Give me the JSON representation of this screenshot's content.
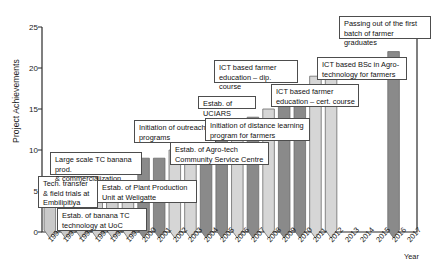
{
  "chart_data": {
    "type": "bar",
    "title": "",
    "xlabel": "Year",
    "ylabel": "Project Achievements",
    "ylim": [
      0,
      25
    ],
    "yticks": [
      0,
      5,
      10,
      15,
      20,
      25
    ],
    "grid": false,
    "legend": "none",
    "categories": [
      "1994",
      "1995",
      "1996",
      "1997",
      "1998",
      "1999",
      "2000",
      "2001",
      "2002",
      "2003",
      "2004",
      "2005",
      "2006",
      "2007",
      "2008",
      "2009",
      "2010",
      "2011",
      "2012",
      "2013",
      "2014",
      "2015",
      "2016",
      "2017"
    ],
    "values": [
      3,
      3,
      3,
      4,
      4,
      5,
      9,
      9,
      10,
      12,
      12,
      12,
      12,
      14,
      15,
      16,
      16,
      19,
      19,
      0,
      0,
      0,
      22,
      0
    ],
    "series": [
      {
        "name": "Project Achievements",
        "values": [
          3,
          3,
          3,
          4,
          4,
          5,
          9,
          9,
          10,
          12,
          12,
          12,
          12,
          14,
          15,
          16,
          16,
          19,
          19,
          0,
          0,
          0,
          22,
          0
        ]
      }
    ],
    "bar_shape": "pointed-bottom-chevron",
    "bar_colors": [
      "#c9c9c9",
      "#c9c9c9",
      "#c9c9c9",
      "#cfcfcf",
      "#cfcfcf",
      "#d2d2d2",
      "#8a8a8a",
      "#8a8a8a",
      "#d6d6d6",
      "#d6d6d6",
      "#8a8a8a",
      "#8a8a8a",
      "#d6d6d6",
      "#8a8a8a",
      "#d6d6d6",
      "#8a8a8a",
      "#8a8a8a",
      "#d6d6d6",
      "#d6d6d6",
      "",
      "",
      "",
      "#8a8a8a",
      ""
    ],
    "annotations": [
      {
        "text": "Tech. transfer\n& field trials at\nEmbilipitiya",
        "year": 1994
      },
      {
        "text": "Estab. of banana TC\ntechnology at UoC",
        "year": 1996
      },
      {
        "text": "Large scale TC banana prod.\n& commercialization",
        "year": 1997
      },
      {
        "text": "Estab. of Plant Production\nUnit at Weligatte",
        "year": 1999
      },
      {
        "text": "Initiation of outreach\nprograms",
        "year": 2002
      },
      {
        "text": "Estab. of Agro-tech\nCommunity Service Centre",
        "year": 2003
      },
      {
        "text": "Estab. of UCIARS",
        "year": 2005
      },
      {
        "text": "Initiation of distance learning\nprogram for farmers",
        "year": 2006
      },
      {
        "text": "ICT based farmer\neducation – dip. course",
        "year": 2007
      },
      {
        "text": "ICT based farmer\neducation – cert. course",
        "year": 2009
      },
      {
        "text": "ICT based BSc in Agro-\ntechnology for farmers",
        "year": 2011
      },
      {
        "text": "Passing out of the first\nbatch of farmer graduates",
        "year": 2014
      }
    ]
  },
  "axis": {
    "y_label": "Project Achievements",
    "x_label": "Year",
    "y_ticks": [
      "0",
      "5",
      "10",
      "15",
      "20",
      "25"
    ],
    "x_ticks": [
      "1994",
      "1995",
      "1996",
      "1997",
      "1998",
      "1999",
      "2000",
      "2001",
      "2002",
      "2003",
      "2004",
      "2005",
      "2006",
      "2007",
      "2008",
      "2009",
      "2010",
      "2011",
      "2012",
      "2013",
      "2014",
      "2015",
      "2016",
      "2017"
    ]
  },
  "callouts": [
    {
      "id": "tech-transfer",
      "text": "Tech. transfer\n& field trials at\nEmbilipitiya"
    },
    {
      "id": "banana-tc",
      "text": "Estab. of banana TC\ntechnology at UoC"
    },
    {
      "id": "large-scale-tc",
      "text": "Large scale TC banana prod.\n& commercialization"
    },
    {
      "id": "plant-production-unit",
      "text": "Estab. of Plant Production\nUnit at Weligatte"
    },
    {
      "id": "outreach-programs",
      "text": "Initiation of outreach\nprograms"
    },
    {
      "id": "agro-tech-centre",
      "text": "Estab. of Agro-tech\nCommunity Service Centre"
    },
    {
      "id": "uciars",
      "text": "Estab. of UCIARS"
    },
    {
      "id": "distance-learning",
      "text": "Initiation of distance learning\nprogram for farmers"
    },
    {
      "id": "dip-course",
      "text": "ICT based farmer\neducation – dip. course"
    },
    {
      "id": "cert-course",
      "text": "ICT based farmer\neducation – cert. course"
    },
    {
      "id": "bsc-agro-tech",
      "text": "ICT based BSc in Agro-\ntechnology for farmers"
    },
    {
      "id": "farmer-graduates",
      "text": "Passing out of the first\nbatch of farmer graduates"
    }
  ]
}
